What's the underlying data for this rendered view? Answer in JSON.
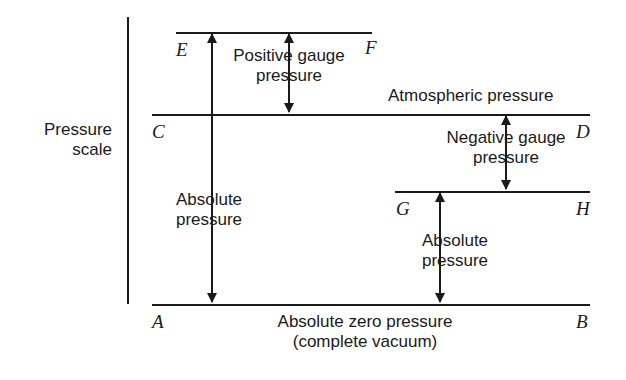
{
  "diagram": {
    "title_axis": {
      "line1": "Pressure",
      "line2": "scale"
    },
    "levels": [
      {
        "id": "EF",
        "left_label": "E",
        "right_label": "F"
      },
      {
        "id": "CD",
        "left_label": "C",
        "right_label": "D"
      },
      {
        "id": "GH",
        "left_label": "G",
        "right_label": "H"
      },
      {
        "id": "AB",
        "left_label": "A",
        "right_label": "B"
      }
    ],
    "annotations": {
      "positive_gauge": {
        "line1": "Positive gauge",
        "line2": "pressure"
      },
      "negative_gauge": {
        "line1": "Negative gauge",
        "line2": "pressure"
      },
      "atmospheric": "Atmospheric pressure",
      "absolute_left": {
        "line1": "Absolute",
        "line2": "pressure"
      },
      "absolute_right": {
        "line1": "Absolute",
        "line2": "pressure"
      },
      "zero_line": {
        "line1": "Absolute zero pressure",
        "line2": "(complete vacuum)"
      }
    },
    "colors": {
      "ink": "#1a1a1a",
      "background": "#ffffff"
    }
  }
}
